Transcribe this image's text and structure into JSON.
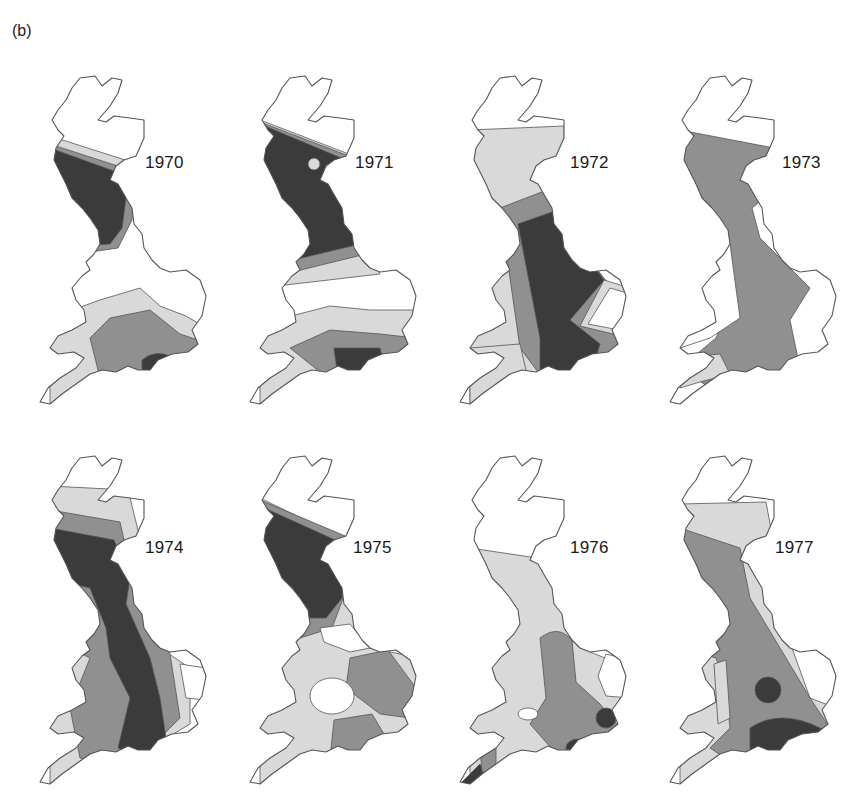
{
  "figure": {
    "panel_label": "(b)",
    "shade_levels": [
      {
        "name": "none",
        "color": "#ffffff"
      },
      {
        "name": "light",
        "color": "#d9d9d9"
      },
      {
        "name": "medium",
        "color": "#909090"
      },
      {
        "name": "dark",
        "color": "#3b3b3b"
      }
    ],
    "outline_color": "#555555",
    "maps": [
      {
        "year": "1970",
        "dominant_dark_region": "western Scotland, small patch south-central England"
      },
      {
        "year": "1971",
        "dominant_dark_region": "Scotland and northern England, patch south-central England"
      },
      {
        "year": "1972",
        "dominant_dark_region": "central and eastern England"
      },
      {
        "year": "1973",
        "dominant_dark_region": "Yorkshire coast; medium shade over most of Britain"
      },
      {
        "year": "1974",
        "dominant_dark_region": "western Scotland and central belt running south through England"
      },
      {
        "year": "1975",
        "dominant_dark_region": "southwest Scotland; light shade across England and Wales"
      },
      {
        "year": "1976",
        "dominant_dark_region": "small patches southeast England and Cornwall; light shade dominant"
      },
      {
        "year": "1977",
        "dominant_dark_region": "southern England and Midlands spot; medium shade west"
      }
    ]
  }
}
